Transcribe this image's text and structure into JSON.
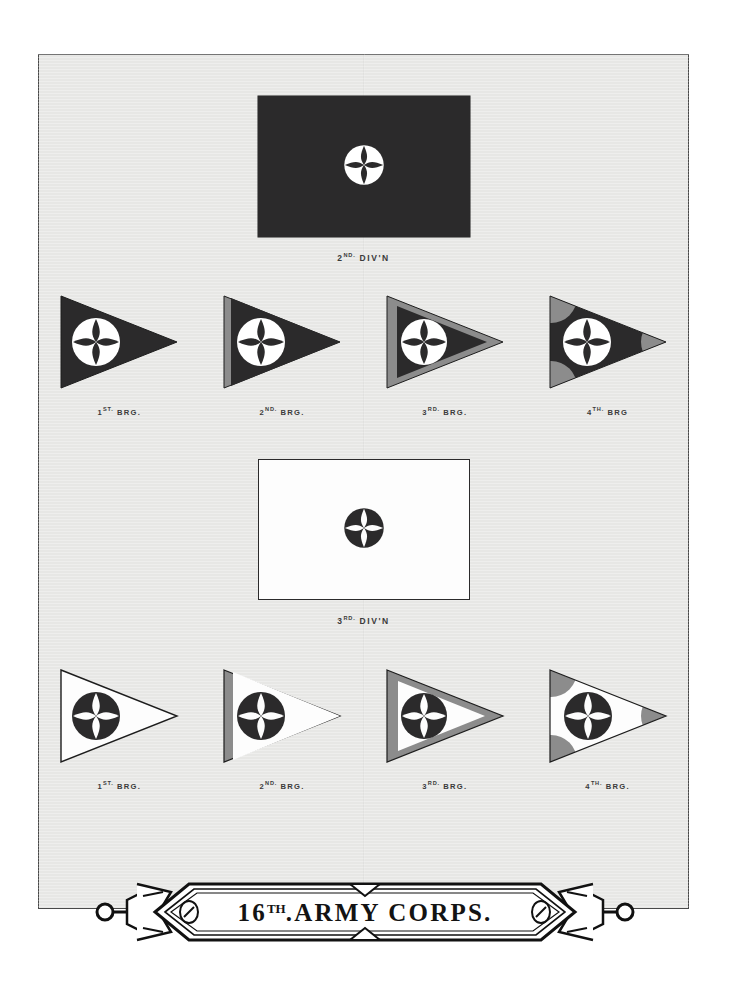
{
  "page": {
    "background_color": "#ffffff",
    "plate_color": "#e9e9e7",
    "plate_border_color": "#4a4a4a"
  },
  "colors": {
    "dark_field": "#2b2a2b",
    "light_field": "#fdfdfd",
    "border_grey": "#8c8c8c",
    "outline": "#1d1d1d",
    "label_text": "#3b3b3b"
  },
  "emblem": {
    "name": "pierced-cross-disc",
    "description": "Circular disc with four petal shaped cut-outs forming a cross"
  },
  "sections": [
    {
      "id": "second-division",
      "division_label": "2ND. DIV'N",
      "division_label_main": "2",
      "division_label_sup": "ND.",
      "division_label_rest": "DIV'N",
      "field_style": "dark",
      "field_color": "#2b2a2b",
      "emblem_color": "#ffffff",
      "brigades": [
        {
          "label_num": "1",
          "label_sup": "ST.",
          "label_rest": "BRG.",
          "label": "1ST. BRG.",
          "border": "none"
        },
        {
          "label_num": "2",
          "label_sup": "ND.",
          "label_rest": "BRG.",
          "label": "2ND. BRG.",
          "border": "hoist"
        },
        {
          "label_num": "3",
          "label_sup": "RD.",
          "label_rest": "BRG.",
          "label": "3RD. BRG.",
          "border": "full"
        },
        {
          "label_num": "4",
          "label_sup": "TH.",
          "label_rest": "BRG",
          "label": "4TH. BRG",
          "border": "corners"
        }
      ]
    },
    {
      "id": "third-division",
      "division_label": "3RD. DIV'N",
      "division_label_main": "3",
      "division_label_sup": "RD.",
      "division_label_rest": "DIV'N",
      "field_style": "light",
      "field_color": "#fdfdfd",
      "emblem_color": "#2b2a2b",
      "brigades": [
        {
          "label_num": "1",
          "label_sup": "ST.",
          "label_rest": "BRG.",
          "label": "1ST. BRG.",
          "border": "none"
        },
        {
          "label_num": "2",
          "label_sup": "ND.",
          "label_rest": "BRG.",
          "label": "2ND. BRG.",
          "border": "hoist"
        },
        {
          "label_num": "3",
          "label_sup": "RD.",
          "label_rest": "BRG.",
          "label": "3RD. BRG.",
          "border": "full"
        },
        {
          "label_num": "4",
          "label_sup": "TH.",
          "label_rest": "BRG.",
          "label": "4TH. BRG.",
          "border": "corners"
        }
      ]
    }
  ],
  "banner": {
    "number": "16",
    "ordinal": "TH",
    "ordinal_dot": ".",
    "words": "ARMY  CORPS.",
    "full_text": "16TH. ARMY CORPS."
  }
}
